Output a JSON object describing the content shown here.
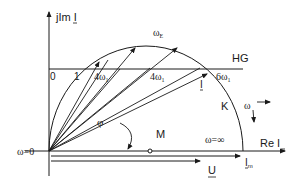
{
  "diagram": {
    "type": "circle-diagram (current locus / Ortskurve)",
    "axes": {
      "imag_label": "jIm I",
      "real_label": "Re I"
    },
    "labels": {
      "omega_zero": "ω=0",
      "omega_inf": "ω=∞",
      "omega_E": "ω",
      "omega_E_sub": "E",
      "hg": "HG",
      "k": "K",
      "m": "M",
      "phi": "φ",
      "omega_dir": "ω",
      "i_vec": "I",
      "i_m": "I",
      "i_m_sub": "m",
      "u": "U"
    },
    "hg_scale": [
      {
        "text": "0",
        "sub": ""
      },
      {
        "text": "1",
        "sub": ""
      },
      {
        "text": "4ω",
        "sub": "1"
      },
      {
        "text": "4ω",
        "sub": "1"
      },
      {
        "text": "6ω",
        "sub": "1"
      }
    ],
    "colors": {
      "line": "#1a1a1a",
      "background": "#ffffff"
    }
  }
}
